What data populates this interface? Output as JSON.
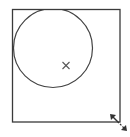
{
  "canvas": {
    "width": 130,
    "height": 137,
    "background": "#ffffff"
  },
  "colors": {
    "stroke": "#3a3a3a",
    "circle": "#444444",
    "marker": "#555555",
    "handle": "#333333"
  },
  "frame": {
    "x": 12.5,
    "y": 9.5,
    "width": 107.5,
    "height": 112.5
  },
  "circle": {
    "cx": 53,
    "cy": 48,
    "r": 39.5
  },
  "center_marker": {
    "x": 66,
    "y": 65.5,
    "size": 3.5,
    "glyph": "x-mark"
  },
  "resize_handle": {
    "x1": 110,
    "y1": 114,
    "x2": 127,
    "y2": 131,
    "icon": "diagonal-resize-arrow"
  }
}
